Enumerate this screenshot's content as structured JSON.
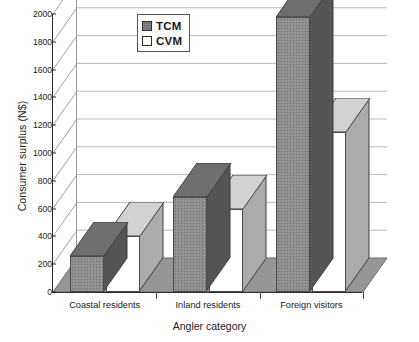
{
  "chart_data": {
    "type": "bar",
    "title": "",
    "xlabel": "Angler category",
    "ylabel": "Consumer surplus (N$)",
    "categories": [
      "Coastal residents",
      "Inland residents",
      "Foreign visitors"
    ],
    "series": [
      {
        "name": "TCM",
        "values": [
          260,
          680,
          1980
        ],
        "color": "#8e8e8e"
      },
      {
        "name": "CVM",
        "values": [
          400,
          600,
          1150
        ],
        "color": "#ffffff"
      }
    ],
    "ylim": [
      0,
      2000
    ],
    "yticks": [
      0,
      200,
      400,
      600,
      800,
      1000,
      1200,
      1400,
      1600,
      1800,
      2000
    ],
    "ytick_labels": [
      "0",
      "200",
      "400",
      "600",
      "800",
      "1000",
      "1200",
      "1400",
      "1600",
      "1800",
      "2000"
    ],
    "grid": true,
    "legend_position": "top-center",
    "style": "3d-grouped-bar"
  },
  "legend": {
    "entries": [
      {
        "label": "TCM",
        "swatch": "tcm-swatch"
      },
      {
        "label": "CVM",
        "swatch": "cvm-swatch"
      }
    ]
  },
  "axes": {
    "y_title": "Consumer surplus (N$)",
    "x_title": "Angler category"
  }
}
